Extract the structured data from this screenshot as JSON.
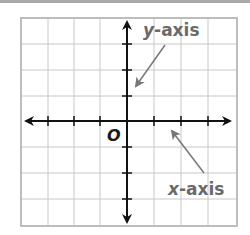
{
  "diagram": {
    "grid": {
      "left": 21,
      "top": 18,
      "right": 237,
      "bottom": 226,
      "columns": 8,
      "rows": 8,
      "line_color": "#c8c8c8",
      "border_color": "#bdbdbd"
    },
    "axes": {
      "color": "#111111",
      "x_axis_y": 121,
      "y_axis_x": 127
    },
    "labels": {
      "origin": "O",
      "y_axis_var": "y",
      "y_axis_suffix": "-axis",
      "x_axis_var": "x",
      "x_axis_suffix": "-axis"
    },
    "pointer_color": "#777777",
    "label_color": "#6a6a6a"
  }
}
